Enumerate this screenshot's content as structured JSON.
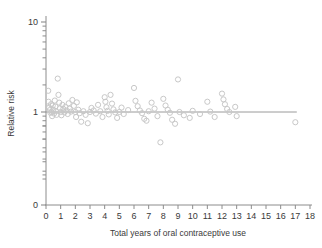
{
  "chart_data": {
    "type": "scatter",
    "title": "",
    "xlabel": "Total years of oral contraceptive use",
    "ylabel": "Relative risk",
    "xlim": [
      0,
      18
    ],
    "ylim_log": [
      0.18,
      10
    ],
    "yscale": "log",
    "grid": false,
    "legend": null,
    "xticks": [
      "0",
      "1",
      "2",
      "3",
      "4",
      "5",
      "6",
      "7",
      "8",
      "9",
      "10",
      "11",
      "12",
      "13",
      "14",
      "15",
      "16",
      "17",
      "18"
    ],
    "yticks_labeled": [
      "0",
      "1",
      "10"
    ],
    "yticks_minor": [
      0.2,
      0.3,
      0.4,
      0.5,
      0.6,
      0.7,
      0.8,
      0.9,
      2,
      3,
      4,
      5,
      6,
      7,
      8,
      9
    ],
    "marker": "open-circle",
    "marker_color": "#c8c8c8",
    "reference_line": {
      "y": 1.0,
      "x_from": 0.0,
      "x_to": 17.1,
      "color": "#9a9a9a"
    },
    "points": [
      [
        0.15,
        1.72
      ],
      [
        0.18,
        1.3
      ],
      [
        0.22,
        1.12
      ],
      [
        0.26,
        1.05
      ],
      [
        0.3,
        0.98
      ],
      [
        0.34,
        1.22
      ],
      [
        0.38,
        1.0
      ],
      [
        0.42,
        0.9
      ],
      [
        0.46,
        1.18
      ],
      [
        0.5,
        1.06
      ],
      [
        0.55,
        0.96
      ],
      [
        0.6,
        1.34
      ],
      [
        0.64,
        1.15
      ],
      [
        0.68,
        1.02
      ],
      [
        0.72,
        0.93
      ],
      [
        0.8,
        2.35
      ],
      [
        0.85,
        1.55
      ],
      [
        0.9,
        1.27
      ],
      [
        0.95,
        1.1
      ],
      [
        1.0,
        1.0
      ],
      [
        1.05,
        0.92
      ],
      [
        1.12,
        1.2
      ],
      [
        1.18,
        1.08
      ],
      [
        1.25,
        0.99
      ],
      [
        1.32,
        1.14
      ],
      [
        1.4,
        1.04
      ],
      [
        1.48,
        0.95
      ],
      [
        1.55,
        1.25
      ],
      [
        1.62,
        1.09
      ],
      [
        1.7,
        1.01
      ],
      [
        1.8,
        1.36
      ],
      [
        1.9,
        1.17
      ],
      [
        2.0,
        1.0
      ],
      [
        2.05,
        0.88
      ],
      [
        2.1,
        1.28
      ],
      [
        2.2,
        1.06
      ],
      [
        2.3,
        0.97
      ],
      [
        2.4,
        0.78
      ],
      [
        2.55,
        1.02
      ],
      [
        2.7,
        0.93
      ],
      [
        2.85,
        0.75
      ],
      [
        3.0,
        1.0
      ],
      [
        3.1,
        1.11
      ],
      [
        3.25,
        1.04
      ],
      [
        3.4,
        0.96
      ],
      [
        3.55,
        1.2
      ],
      [
        3.7,
        1.02
      ],
      [
        3.85,
        0.88
      ],
      [
        4.0,
        1.46
      ],
      [
        4.05,
        1.3
      ],
      [
        4.12,
        1.13
      ],
      [
        4.2,
        1.03
      ],
      [
        4.28,
        0.94
      ],
      [
        4.4,
        1.55
      ],
      [
        4.5,
        1.24
      ],
      [
        4.6,
        1.07
      ],
      [
        4.72,
        0.99
      ],
      [
        4.85,
        0.86
      ],
      [
        5.0,
        1.0
      ],
      [
        5.15,
        1.12
      ],
      [
        5.3,
        0.95
      ],
      [
        5.6,
        1.05
      ],
      [
        6.0,
        1.85
      ],
      [
        6.1,
        1.33
      ],
      [
        6.25,
        1.16
      ],
      [
        6.4,
        1.04
      ],
      [
        6.55,
        0.97
      ],
      [
        6.7,
        0.84
      ],
      [
        6.85,
        0.8
      ],
      [
        7.0,
        1.02
      ],
      [
        7.2,
        1.27
      ],
      [
        7.4,
        1.09
      ],
      [
        7.6,
        0.9
      ],
      [
        7.8,
        0.46
      ],
      [
        8.0,
        1.4
      ],
      [
        8.15,
        1.18
      ],
      [
        8.3,
        1.06
      ],
      [
        8.45,
        0.98
      ],
      [
        8.6,
        0.82
      ],
      [
        8.8,
        0.74
      ],
      [
        9.0,
        2.3
      ],
      [
        9.1,
        1.0
      ],
      [
        9.4,
        0.92
      ],
      [
        9.8,
        0.86
      ],
      [
        10.0,
        1.03
      ],
      [
        10.5,
        0.95
      ],
      [
        11.0,
        1.3
      ],
      [
        11.2,
        1.01
      ],
      [
        11.5,
        0.88
      ],
      [
        12.0,
        1.6
      ],
      [
        12.1,
        1.38
      ],
      [
        12.2,
        1.22
      ],
      [
        12.35,
        1.08
      ],
      [
        12.5,
        1.0
      ],
      [
        12.9,
        1.14
      ],
      [
        13.0,
        0.9
      ],
      [
        17.0,
        0.77
      ]
    ]
  },
  "figure": {
    "background_color": "#ffffff",
    "axis_color": "#8c8c8c",
    "text_color": "#3a3a3a"
  }
}
